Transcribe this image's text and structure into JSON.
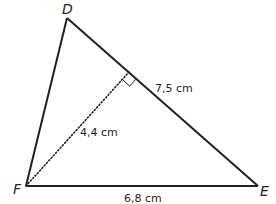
{
  "diagram": {
    "type": "triangle",
    "vertices": [
      {
        "name": "D",
        "x": 67,
        "y": 18
      },
      {
        "name": "E",
        "x": 258,
        "y": 186
      },
      {
        "name": "F",
        "x": 26,
        "y": 186
      }
    ],
    "altitude": {
      "from": "F",
      "to_side": "DE",
      "foot": {
        "x": 129,
        "y": 72
      },
      "style": "dotted",
      "right_angle_marker": true
    },
    "labels": {
      "vertex_d": "D",
      "vertex_e": "E",
      "vertex_f": "F",
      "side_de": "7,5 cm",
      "altitude_f": "4,4 cm",
      "side_fe": "6,8 cm"
    },
    "colors": {
      "line": "#231f20",
      "background": "#ffffff"
    }
  }
}
